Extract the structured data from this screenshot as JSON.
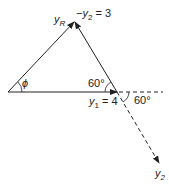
{
  "diagram": {
    "labels": {
      "yR": "y",
      "yR_sub": "R",
      "minus_y2_prefix": "−y",
      "minus_y2_sub": "2",
      "minus_y2_value": " = 3",
      "phi": "ϕ",
      "angle_top": "60°",
      "y1_prefix": "y",
      "y1_sub": "1",
      "y1_value": " = 4",
      "angle_right": "60°",
      "y2": "y",
      "y2_sub": "2"
    },
    "colors": {
      "line": "#222222"
    }
  }
}
